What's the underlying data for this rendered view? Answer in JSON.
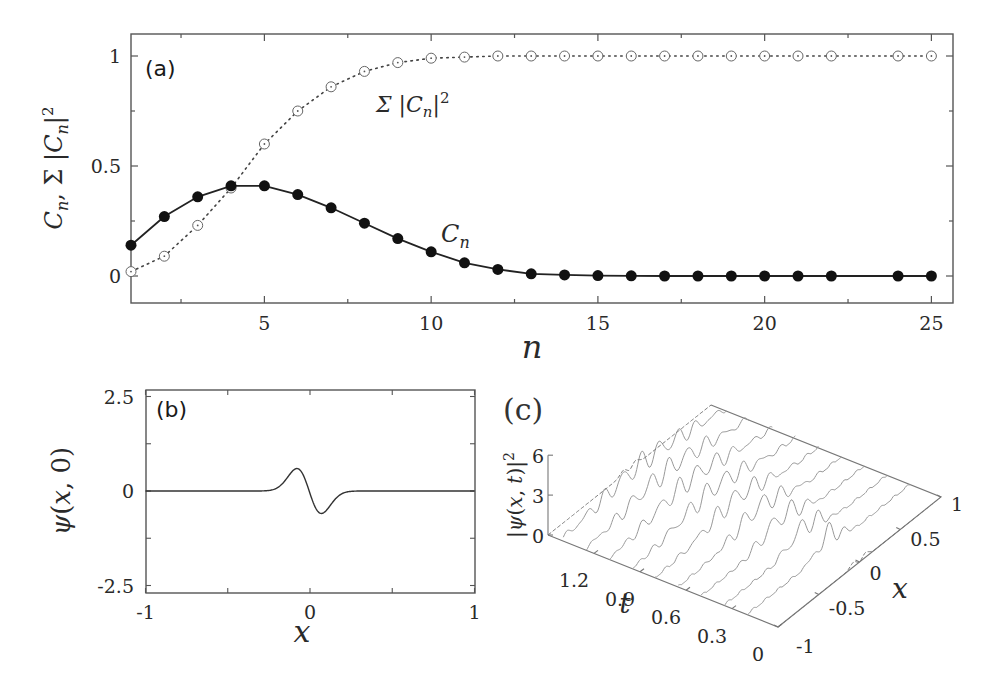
{
  "figure": {
    "panels": [
      "(a)",
      "(b)",
      "(c)"
    ]
  },
  "chart_data": [
    {
      "id": "a",
      "type": "line",
      "panel_label": "(a)",
      "xlabel": "n",
      "ylabel": "C_n, Σ|C_n|²",
      "xlim": [
        1,
        26
      ],
      "ylim": [
        -0.1,
        1.1
      ],
      "xticks": [
        5,
        10,
        15,
        20,
        25
      ],
      "yticks": [
        0,
        0.5,
        1
      ],
      "ytick_labels": [
        "0",
        "0.5",
        "1"
      ],
      "series": [
        {
          "name": "C_n",
          "annotation": "C_n",
          "marker": "filled-circle",
          "line": "solid",
          "x": [
            1,
            2,
            3,
            4,
            5,
            6,
            7,
            8,
            9,
            10,
            11,
            12,
            13,
            14,
            15,
            16,
            17,
            18,
            19,
            20,
            21,
            22,
            24,
            25
          ],
          "values": [
            0.14,
            0.27,
            0.36,
            0.41,
            0.41,
            0.37,
            0.31,
            0.24,
            0.17,
            0.11,
            0.06,
            0.03,
            0.01,
            0.005,
            0.002,
            0.001,
            0,
            0,
            0,
            0,
            0,
            0,
            0,
            0
          ]
        },
        {
          "name": "Σ|C_n|²",
          "annotation": "Σ|C_n|²",
          "marker": "open-circle-dot",
          "line": "dotted",
          "x": [
            1,
            2,
            3,
            4,
            5,
            6,
            7,
            8,
            9,
            10,
            11,
            12,
            13,
            14,
            15,
            16,
            17,
            18,
            19,
            20,
            21,
            22,
            24,
            25
          ],
          "values": [
            0.02,
            0.09,
            0.23,
            0.4,
            0.6,
            0.75,
            0.86,
            0.93,
            0.97,
            0.99,
            0.995,
            1,
            1,
            1,
            1,
            1,
            1,
            1,
            1,
            1,
            1,
            1,
            1,
            1
          ]
        }
      ]
    },
    {
      "id": "b",
      "type": "line",
      "panel_label": "(b)",
      "xlabel": "x",
      "ylabel": "ψ(x,0)",
      "xlim": [
        -1,
        1
      ],
      "ylim": [
        -2.7,
        2.7
      ],
      "xticks": [
        -1,
        0,
        1
      ],
      "xtick_labels": [
        "-1",
        "0",
        "1"
      ],
      "yticks": [
        -2.5,
        0,
        2.5
      ],
      "ytick_labels": [
        "-2.5",
        "0",
        "2.5"
      ],
      "series": [
        {
          "name": "ψ(x,0)",
          "description": "antisymmetric wave packet: minimum ≈ -2.45 at x≈-0.08, maximum ≈ 2.4 at x≈0.07, ≈0 for |x|>0.3",
          "x": [
            -1,
            -0.3,
            -0.25,
            -0.2,
            -0.15,
            -0.12,
            -0.1,
            -0.08,
            -0.06,
            -0.04,
            -0.02,
            0,
            0.02,
            0.04,
            0.06,
            0.07,
            0.08,
            0.1,
            0.12,
            0.15,
            0.2,
            0.25,
            0.3,
            1
          ],
          "values": [
            0,
            0,
            -0.05,
            -0.25,
            -0.9,
            -1.6,
            -2.15,
            -2.45,
            -2.2,
            -1.5,
            -0.6,
            0.2,
            1.2,
            2.0,
            2.38,
            2.4,
            2.3,
            1.8,
            1.2,
            0.6,
            0.15,
            0.02,
            0,
            0
          ]
        }
      ]
    },
    {
      "id": "c",
      "type": "surface-waterfall",
      "panel_label": "(c)",
      "xlabel": "x",
      "ylabel": "t",
      "zlabel": "|ψ(x,t)|²",
      "xticks": [
        -1,
        -0.5,
        0,
        0.5,
        1
      ],
      "xtick_labels": [
        "-1",
        "-0.5",
        "0",
        "0.5",
        "1"
      ],
      "tticks": [
        0,
        0.3,
        0.6,
        0.9,
        1.2
      ],
      "ttick_labels": [
        "0",
        "0.3",
        "0.6",
        "0.9",
        "1.2"
      ],
      "zticks": [
        0,
        3,
        6
      ],
      "ztick_labels": [
        "0",
        "3",
        "6"
      ],
      "description": "time slices of |ψ(x,t)|² as 3D waterfall; dashed tall double peaks at t=0 (x≈0) and at t≈1.5 (x≈0), intermediate slices show oscillatory spreading"
    }
  ]
}
